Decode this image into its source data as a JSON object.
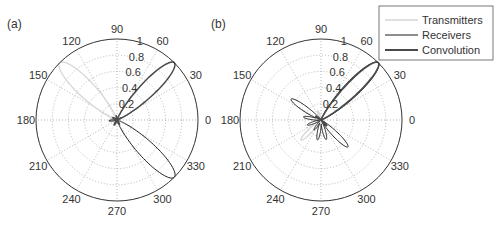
{
  "chart_data": [
    {
      "type": "polar",
      "panel_label": "(a)",
      "center": [
        117,
        120
      ],
      "radius_px": 81,
      "rlim": [
        0,
        1
      ],
      "r_ticks": [
        0.2,
        0.4,
        0.6,
        0.8,
        1
      ],
      "r_tick_labels": [
        "0.2",
        "0.4",
        "0.6",
        "0.8",
        "1"
      ],
      "theta_ticks": [
        0,
        30,
        60,
        90,
        120,
        150,
        180,
        210,
        240,
        270,
        300,
        330
      ],
      "theta_tick_labels": [
        "0",
        "30",
        "60",
        "90",
        "120",
        "150",
        "180",
        "210",
        "240",
        "270",
        "300",
        "330"
      ],
      "grid": true,
      "series": [
        {
          "name": "Transmitters",
          "main_lobe_deg": 135,
          "main_lobe_r": 1.0,
          "lobe_width_deg": 10,
          "sidelobes": [
            {
              "deg": 190,
              "r": 0.1
            },
            {
              "deg": 250,
              "r": 0.07
            },
            {
              "deg": 165,
              "r": 0.08
            }
          ]
        },
        {
          "name": "Receivers",
          "main_lobe_deg": 315,
          "main_lobe_r": 1.0,
          "lobe_width_deg": 10,
          "sidelobes": [
            {
              "deg": 185,
              "r": 0.1
            },
            {
              "deg": 100,
              "r": 0.06
            },
            {
              "deg": 30,
              "r": 0.06
            }
          ]
        },
        {
          "name": "Convolution",
          "main_lobe_deg": 45,
          "main_lobe_r": 1.0,
          "lobe_width_deg": 9,
          "sidelobes": [
            {
              "deg": 150,
              "r": 0.06
            },
            {
              "deg": 240,
              "r": 0.07
            },
            {
              "deg": 300,
              "r": 0.06
            }
          ]
        }
      ]
    },
    {
      "type": "polar",
      "panel_label": "(b)",
      "center": [
        321,
        120
      ],
      "radius_px": 81,
      "rlim": [
        0,
        1
      ],
      "r_ticks": [
        0.2,
        0.4,
        0.6,
        0.8,
        1
      ],
      "r_tick_labels": [
        "0.2",
        "0.4",
        "0.6",
        "0.8",
        "1"
      ],
      "theta_ticks": [
        0,
        30,
        60,
        90,
        120,
        150,
        180,
        210,
        240,
        270,
        300,
        330
      ],
      "theta_tick_labels": [
        "0",
        "30",
        "60",
        "90",
        "120",
        "150",
        "180",
        "210",
        "240",
        "270",
        "300",
        "330"
      ],
      "grid": true,
      "series": [
        {
          "name": "Transmitters",
          "main_lobe_deg": 45,
          "main_lobe_r": 1.0,
          "lobe_width_deg": 9,
          "sidelobes": [
            {
              "deg": 225,
              "r": 0.35
            },
            {
              "deg": 110,
              "r": 0.12
            }
          ]
        },
        {
          "name": "Receivers",
          "main_lobe_deg": 45,
          "main_lobe_r": 1.0,
          "lobe_width_deg": 9,
          "sidelobes": [
            {
              "deg": 145,
              "r": 0.45
            },
            {
              "deg": 315,
              "r": 0.47
            },
            {
              "deg": 170,
              "r": 0.22
            },
            {
              "deg": 200,
              "r": 0.18
            },
            {
              "deg": 260,
              "r": 0.25
            },
            {
              "deg": 285,
              "r": 0.25
            },
            {
              "deg": 235,
              "r": 0.15
            }
          ]
        },
        {
          "name": "Convolution",
          "main_lobe_deg": 45,
          "main_lobe_r": 1.0,
          "lobe_width_deg": 8,
          "sidelobes": [
            {
              "deg": 145,
              "r": 0.08
            },
            {
              "deg": 315,
              "r": 0.1
            }
          ]
        }
      ]
    }
  ],
  "legend": {
    "items": [
      {
        "label": "Transmitters",
        "color": "#d6d6d6",
        "width": 1.5
      },
      {
        "label": "Receivers",
        "color": "#1f1f1f",
        "width": 1.0
      },
      {
        "label": "Convolution",
        "color": "#4a4a4a",
        "width": 1.8
      }
    ]
  },
  "colors": {
    "axis": "#333333",
    "grid": "#9a9a9a",
    "transmitters": "#d6d6d6",
    "receivers": "#1f1f1f",
    "convolution": "#4a4a4a"
  }
}
